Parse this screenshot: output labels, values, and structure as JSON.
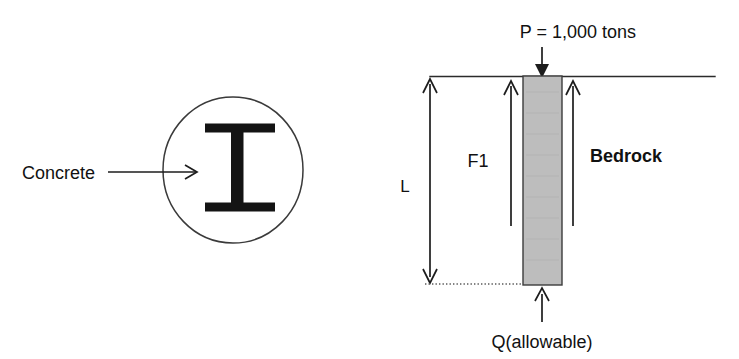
{
  "figure": {
    "background_color": "#ffffff",
    "ink_color": "#1d1d1d"
  },
  "cross_section": {
    "callout_label": "Concrete",
    "shape_name": "circular-pile-cross-section",
    "embedded_shape_name": "i-beam",
    "circle": {
      "cx": 233,
      "cy": 170,
      "rx": 70,
      "ry": 73
    },
    "arrow": {
      "x_start": 108,
      "x_end": 198,
      "y": 172
    }
  },
  "elevation": {
    "load_label": "P = 1,000 tons",
    "skin_friction_label": "F1",
    "material_label": "Bedrock",
    "length_label": "L",
    "base_resistance_label": "Q(allowable)",
    "pile_fill_color": "#bdbdbd",
    "ground_line": {
      "x_start": 430,
      "x_end": 715,
      "y": 76
    },
    "pile": {
      "x": 523,
      "y": 76,
      "width": 39,
      "height": 209
    }
  }
}
